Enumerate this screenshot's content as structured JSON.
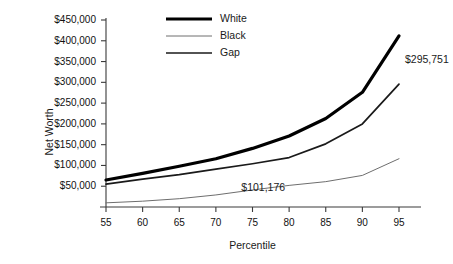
{
  "chart_data": {
    "type": "line",
    "title": "",
    "xlabel": "Percentile",
    "ylabel": "Net Worth",
    "x": [
      55,
      60,
      65,
      70,
      75,
      80,
      85,
      90,
      95
    ],
    "xlim": [
      55,
      95
    ],
    "ylim": [
      0,
      450000
    ],
    "xticks": [
      "55",
      "60",
      "65",
      "70",
      "75",
      "80",
      "85",
      "90",
      "95"
    ],
    "yticks": [
      "$50,000",
      "$100,000",
      "$150,000",
      "$200,000",
      "$250,000",
      "$300,000",
      "$350,000",
      "$400,000",
      "$450,000"
    ],
    "ytick_values": [
      50000,
      100000,
      150000,
      200000,
      250000,
      300000,
      350000,
      400000,
      450000
    ],
    "grid": false,
    "legend_position": "top-center",
    "series": [
      {
        "name": "White",
        "color": "#000000",
        "width": 3.2,
        "values": [
          65000,
          81000,
          98000,
          116000,
          141000,
          171000,
          213000,
          276000,
          411927
        ]
      },
      {
        "name": "Black",
        "color": "#6e6e6e",
        "width": 1.0,
        "values": [
          10000,
          14000,
          20000,
          29000,
          41000,
          52000,
          61000,
          76000,
          116176
        ]
      },
      {
        "name": "Gap",
        "color": "#1a1a1a",
        "width": 1.7,
        "values": [
          55000,
          67000,
          78000,
          91000,
          104000,
          119000,
          152000,
          200000,
          295751
        ]
      }
    ],
    "annotations": [
      {
        "text": "$295,751",
        "x": 95,
        "y": 295751,
        "dx": 6,
        "dy": -24
      },
      {
        "text": "$101,176",
        "x": 80,
        "y": 119000,
        "dx": -4,
        "dy": 30
      }
    ]
  },
  "legend": {
    "items": [
      {
        "label": "White"
      },
      {
        "label": "Black"
      },
      {
        "label": "Gap"
      }
    ]
  },
  "axes": {
    "x_title": "Percentile",
    "y_title": "Net Worth"
  }
}
